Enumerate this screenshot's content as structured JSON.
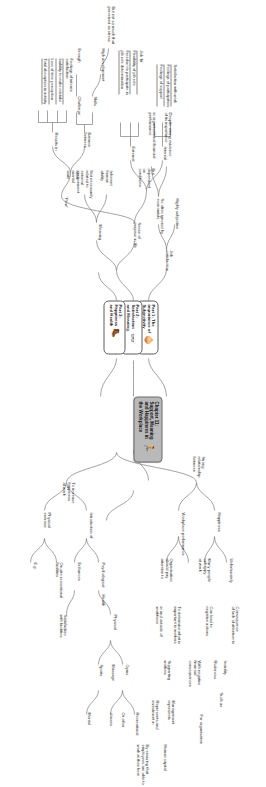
{
  "document": {
    "type": "mind-map",
    "orientation": "rotated-90",
    "center": {
      "title": "Chapter 11:\nSupport, Meaning\nand Happiness in\nthe Workplace",
      "icon": "runner-icon"
    }
  },
  "parts": {
    "part1": {
      "title": "Part 1: The\nimportance of\nSubjectivity",
      "icon": "onion-icon"
    },
    "part2": {
      "title": "Part 2:\nSatisfaction\nand Meaning",
      "icon": "binoculars-icon"
    },
    "part3": {
      "title": "Part 3:\nHappiness\nand Health",
      "icon": "boot-icon"
    }
  },
  "branches": {
    "job_satisfaction": {
      "root": "Job\nsatisfaction",
      "child": "Highly subjective",
      "grandchild": "So often ignored by\neconomists",
      "leaf_a": "Despite strong evidence\nof its importance",
      "leaf_b": "in organisational financial\nperformance"
    },
    "sense_of_purpose": {
      "root": "Sense of\npurpose in life"
    },
    "meaning": {
      "root": "Meaning",
      "children": [
        {
          "label": "Not necessarily\nrelated to\nexternal\nenvironment"
        },
        {
          "label": "Inherent\nhuman\nability"
        }
      ]
    },
    "satisfaction": {
      "root": "But\ndependent\non\nconditions",
      "internal": {
        "label": "Internal",
        "items": [
          "Satisfaction with work",
          "Feelings of participation",
          "Feelings of support"
        ]
      },
      "external": {
        "label": "External",
        "items": [
          "Job 'fit'",
          "Flexibility of job role",
          "Freedom to participate in\njob role determination"
        ]
      }
    },
    "flow": {
      "root": "\"Flow\"",
      "ideal": "Ideal\nmental\nstate",
      "balance": {
        "label": "Balance\nbetween",
        "items_left": [
          "Skills",
          "Challenge"
        ],
        "items_right": [
          "High development",
          "Enough"
        ],
        "note": "But not so much that\nperceived as stress"
      },
      "results": {
        "label": "Results in",
        "items": [
          "Feelings of intense\nsatisfaction",
          "Inability to make mistake",
          "Loss of time perception",
          "Total absorption in activity"
        ]
      }
    },
    "happiness_performance": {
      "root": "Strong\nrelationship\nbetween",
      "items": [
        "Happiness",
        "Workplace performance"
      ]
    },
    "unhappy": {
      "root": "Unfortunately",
      "child": "Many people\nunhappy\nat work",
      "consequence": "Consequence\nof lack of attention to",
      "can_lead": "Can lead to\nnegative actions",
      "negatives": [
        "Incivility",
        "Rudeness",
        "Such as"
      ],
      "financial": "With negative\nfinancial\nconsequences",
      "for_org": "For organisation"
    },
    "management": {
      "root": "Organisation\nshould pay\nattention to",
      "determine": "To determine what is\nimportant to workers",
      "scope": "in and outside of\nworkforce",
      "supporting": "Supporting\nworkers",
      "mgmt_label": "Management\nrepresents",
      "represents": "Represents and\ninvestment in",
      "human_capital": "Human capital",
      "able_to": "By ensuring that\nemployees are able to\nwork at their best"
    },
    "increase_happiness": {
      "root": "To increase\nhappiness\nat work",
      "intro": "Introduction of",
      "physical": "Physical\nexercise",
      "psychological": "Psychological",
      "health": "Health",
      "enhances": "Enhances",
      "onsite": "On-site recreational\nfacilities",
      "eg": "E.g.",
      "satisfaction_facilities": "Satisfaction\nwith facilities",
      "physical2": "Physical",
      "gyms": "Gyms",
      "massage": "Massage",
      "sports": "Sports",
      "recreational": "Recreational",
      "or_other": "Or other",
      "classes": "classes",
      "mental": "Mental"
    }
  }
}
